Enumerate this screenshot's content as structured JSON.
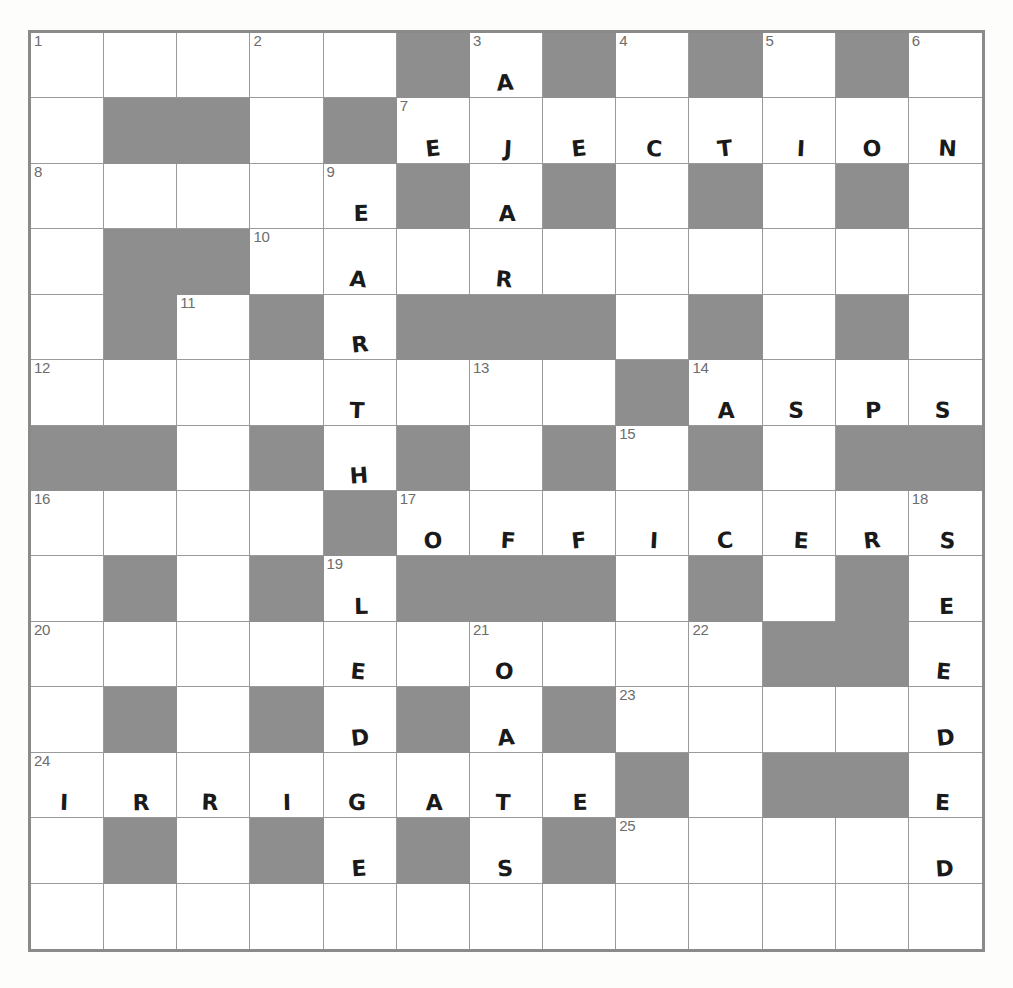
{
  "puzzle": {
    "kind": "crossword-grid",
    "columns": 13,
    "rows": 14,
    "colors": {
      "block": "#8e8e8e",
      "cell": "#ffffff",
      "gridline": "#9a9a9a",
      "border": "#8a8a8a",
      "number": "#6d6d6d",
      "letter": "#1a1a1a"
    },
    "answers_entered": {
      "across": [
        {
          "number": "7",
          "text": "EJECTION"
        },
        {
          "number": "14",
          "text": "ASPS"
        },
        {
          "number": "17",
          "text": "OFFICERS"
        },
        {
          "number": "24",
          "text": "IRRIGATE"
        }
      ],
      "down": [
        {
          "number": "9",
          "text": "EARTHLEDGE"
        },
        {
          "number": "3",
          "text": "AARTOASTS"
        },
        {
          "number": "18",
          "text": "SEEDED"
        }
      ]
    },
    "cells": [
      [
        {
          "b": false,
          "n": "1",
          "l": ""
        },
        {
          "b": false,
          "n": "",
          "l": ""
        },
        {
          "b": false,
          "n": "",
          "l": ""
        },
        {
          "b": false,
          "n": "2",
          "l": ""
        },
        {
          "b": false,
          "n": "",
          "l": ""
        },
        {
          "b": true,
          "n": "",
          "l": ""
        },
        {
          "b": false,
          "n": "3",
          "l": "A"
        },
        {
          "b": true,
          "n": "",
          "l": ""
        },
        {
          "b": false,
          "n": "4",
          "l": ""
        },
        {
          "b": true,
          "n": "",
          "l": ""
        },
        {
          "b": false,
          "n": "5",
          "l": ""
        },
        {
          "b": true,
          "n": "",
          "l": ""
        },
        {
          "b": false,
          "n": "6",
          "l": ""
        }
      ],
      [
        {
          "b": false,
          "n": "",
          "l": ""
        },
        {
          "b": true,
          "n": "",
          "l": ""
        },
        {
          "b": true,
          "n": "",
          "l": ""
        },
        {
          "b": false,
          "n": "",
          "l": ""
        },
        {
          "b": true,
          "n": "",
          "l": ""
        },
        {
          "b": false,
          "n": "7",
          "l": "E"
        },
        {
          "b": false,
          "n": "",
          "l": "J"
        },
        {
          "b": false,
          "n": "",
          "l": "E"
        },
        {
          "b": false,
          "n": "",
          "l": "C"
        },
        {
          "b": false,
          "n": "",
          "l": "T"
        },
        {
          "b": false,
          "n": "",
          "l": "I"
        },
        {
          "b": false,
          "n": "",
          "l": "O"
        },
        {
          "b": false,
          "n": "",
          "l": "N"
        }
      ],
      [
        {
          "b": false,
          "n": "8",
          "l": ""
        },
        {
          "b": false,
          "n": "",
          "l": ""
        },
        {
          "b": false,
          "n": "",
          "l": ""
        },
        {
          "b": false,
          "n": "",
          "l": ""
        },
        {
          "b": false,
          "n": "9",
          "l": "E"
        },
        {
          "b": true,
          "n": "",
          "l": ""
        },
        {
          "b": false,
          "n": "",
          "l": "A"
        },
        {
          "b": true,
          "n": "",
          "l": ""
        },
        {
          "b": false,
          "n": "",
          "l": ""
        },
        {
          "b": true,
          "n": "",
          "l": ""
        },
        {
          "b": false,
          "n": "",
          "l": ""
        },
        {
          "b": true,
          "n": "",
          "l": ""
        },
        {
          "b": false,
          "n": "",
          "l": ""
        }
      ],
      [
        {
          "b": false,
          "n": "",
          "l": ""
        },
        {
          "b": true,
          "n": "",
          "l": ""
        },
        {
          "b": true,
          "n": "",
          "l": ""
        },
        {
          "b": false,
          "n": "10",
          "l": ""
        },
        {
          "b": false,
          "n": "",
          "l": "A"
        },
        {
          "b": false,
          "n": "",
          "l": ""
        },
        {
          "b": false,
          "n": "",
          "l": "R"
        },
        {
          "b": false,
          "n": "",
          "l": ""
        },
        {
          "b": false,
          "n": "",
          "l": ""
        },
        {
          "b": false,
          "n": "",
          "l": ""
        },
        {
          "b": false,
          "n": "",
          "l": ""
        },
        {
          "b": false,
          "n": "",
          "l": ""
        },
        {
          "b": false,
          "n": "",
          "l": ""
        }
      ],
      [
        {
          "b": false,
          "n": "",
          "l": ""
        },
        {
          "b": true,
          "n": "",
          "l": ""
        },
        {
          "b": false,
          "n": "11",
          "l": ""
        },
        {
          "b": true,
          "n": "",
          "l": ""
        },
        {
          "b": false,
          "n": "",
          "l": "R"
        },
        {
          "b": true,
          "n": "",
          "l": ""
        },
        {
          "b": true,
          "n": "",
          "l": ""
        },
        {
          "b": true,
          "n": "",
          "l": ""
        },
        {
          "b": false,
          "n": "",
          "l": ""
        },
        {
          "b": true,
          "n": "",
          "l": ""
        },
        {
          "b": false,
          "n": "",
          "l": ""
        },
        {
          "b": true,
          "n": "",
          "l": ""
        },
        {
          "b": false,
          "n": "",
          "l": ""
        }
      ],
      [
        {
          "b": false,
          "n": "12",
          "l": ""
        },
        {
          "b": false,
          "n": "",
          "l": ""
        },
        {
          "b": false,
          "n": "",
          "l": ""
        },
        {
          "b": false,
          "n": "",
          "l": ""
        },
        {
          "b": false,
          "n": "",
          "l": "T"
        },
        {
          "b": false,
          "n": "",
          "l": ""
        },
        {
          "b": false,
          "n": "13",
          "l": ""
        },
        {
          "b": false,
          "n": "",
          "l": ""
        },
        {
          "b": true,
          "n": "",
          "l": ""
        },
        {
          "b": false,
          "n": "14",
          "l": "A"
        },
        {
          "b": false,
          "n": "",
          "l": "S"
        },
        {
          "b": false,
          "n": "",
          "l": "P"
        },
        {
          "b": false,
          "n": "",
          "l": "S"
        }
      ],
      [
        {
          "b": true,
          "n": "",
          "l": ""
        },
        {
          "b": true,
          "n": "",
          "l": ""
        },
        {
          "b": false,
          "n": "",
          "l": ""
        },
        {
          "b": true,
          "n": "",
          "l": ""
        },
        {
          "b": false,
          "n": "",
          "l": "H"
        },
        {
          "b": true,
          "n": "",
          "l": ""
        },
        {
          "b": false,
          "n": "",
          "l": ""
        },
        {
          "b": true,
          "n": "",
          "l": ""
        },
        {
          "b": false,
          "n": "15",
          "l": ""
        },
        {
          "b": true,
          "n": "",
          "l": ""
        },
        {
          "b": false,
          "n": "",
          "l": ""
        },
        {
          "b": true,
          "n": "",
          "l": ""
        },
        {
          "b": true,
          "n": "",
          "l": ""
        }
      ],
      [
        {
          "b": false,
          "n": "16",
          "l": ""
        },
        {
          "b": false,
          "n": "",
          "l": ""
        },
        {
          "b": false,
          "n": "",
          "l": ""
        },
        {
          "b": false,
          "n": "",
          "l": ""
        },
        {
          "b": true,
          "n": "",
          "l": ""
        },
        {
          "b": false,
          "n": "17",
          "l": "O"
        },
        {
          "b": false,
          "n": "",
          "l": "F"
        },
        {
          "b": false,
          "n": "",
          "l": "F"
        },
        {
          "b": false,
          "n": "",
          "l": "I"
        },
        {
          "b": false,
          "n": "",
          "l": "C"
        },
        {
          "b": false,
          "n": "",
          "l": "E"
        },
        {
          "b": false,
          "n": "",
          "l": "R"
        },
        {
          "b": false,
          "n": "18",
          "l": "S"
        }
      ],
      [
        {
          "b": false,
          "n": "",
          "l": ""
        },
        {
          "b": true,
          "n": "",
          "l": ""
        },
        {
          "b": false,
          "n": "",
          "l": ""
        },
        {
          "b": true,
          "n": "",
          "l": ""
        },
        {
          "b": false,
          "n": "19",
          "l": "L"
        },
        {
          "b": true,
          "n": "",
          "l": ""
        },
        {
          "b": true,
          "n": "",
          "l": ""
        },
        {
          "b": true,
          "n": "",
          "l": ""
        },
        {
          "b": false,
          "n": "",
          "l": ""
        },
        {
          "b": true,
          "n": "",
          "l": ""
        },
        {
          "b": false,
          "n": "",
          "l": ""
        },
        {
          "b": true,
          "n": "",
          "l": ""
        },
        {
          "b": false,
          "n": "",
          "l": "E"
        }
      ],
      [
        {
          "b": false,
          "n": "20",
          "l": ""
        },
        {
          "b": false,
          "n": "",
          "l": ""
        },
        {
          "b": false,
          "n": "",
          "l": ""
        },
        {
          "b": false,
          "n": "",
          "l": ""
        },
        {
          "b": false,
          "n": "",
          "l": "E"
        },
        {
          "b": false,
          "n": "",
          "l": ""
        },
        {
          "b": false,
          "n": "21",
          "l": "O"
        },
        {
          "b": false,
          "n": "",
          "l": ""
        },
        {
          "b": false,
          "n": "",
          "l": ""
        },
        {
          "b": false,
          "n": "22",
          "l": ""
        },
        {
          "b": true,
          "n": "",
          "l": ""
        },
        {
          "b": true,
          "n": "",
          "l": ""
        },
        {
          "b": false,
          "n": "",
          "l": "E"
        }
      ],
      [
        {
          "b": false,
          "n": "",
          "l": ""
        },
        {
          "b": true,
          "n": "",
          "l": ""
        },
        {
          "b": false,
          "n": "",
          "l": ""
        },
        {
          "b": true,
          "n": "",
          "l": ""
        },
        {
          "b": false,
          "n": "",
          "l": "D"
        },
        {
          "b": true,
          "n": "",
          "l": ""
        },
        {
          "b": false,
          "n": "",
          "l": "A"
        },
        {
          "b": true,
          "n": "",
          "l": ""
        },
        {
          "b": false,
          "n": "23",
          "l": ""
        },
        {
          "b": false,
          "n": "",
          "l": ""
        },
        {
          "b": false,
          "n": "",
          "l": ""
        },
        {
          "b": false,
          "n": "",
          "l": ""
        },
        {
          "b": false,
          "n": "",
          "l": "D"
        }
      ],
      [
        {
          "b": false,
          "n": "24",
          "l": "I"
        },
        {
          "b": false,
          "n": "",
          "l": "R"
        },
        {
          "b": false,
          "n": "",
          "l": "R"
        },
        {
          "b": false,
          "n": "",
          "l": "I"
        },
        {
          "b": false,
          "n": "",
          "l": "G"
        },
        {
          "b": false,
          "n": "",
          "l": "A"
        },
        {
          "b": false,
          "n": "",
          "l": "T"
        },
        {
          "b": false,
          "n": "",
          "l": "E"
        },
        {
          "b": true,
          "n": "",
          "l": ""
        },
        {
          "b": false,
          "n": "",
          "l": ""
        },
        {
          "b": true,
          "n": "",
          "l": ""
        },
        {
          "b": true,
          "n": "",
          "l": ""
        },
        {
          "b": false,
          "n": "",
          "l": "E"
        }
      ],
      [
        {
          "b": false,
          "n": "",
          "l": ""
        },
        {
          "b": true,
          "n": "",
          "l": ""
        },
        {
          "b": false,
          "n": "",
          "l": ""
        },
        {
          "b": true,
          "n": "",
          "l": ""
        },
        {
          "b": false,
          "n": "",
          "l": "E"
        },
        {
          "b": true,
          "n": "",
          "l": ""
        },
        {
          "b": false,
          "n": "",
          "l": "S"
        },
        {
          "b": true,
          "n": "",
          "l": ""
        },
        {
          "b": false,
          "n": "25",
          "l": ""
        },
        {
          "b": false,
          "n": "",
          "l": ""
        },
        {
          "b": false,
          "n": "",
          "l": ""
        },
        {
          "b": false,
          "n": "",
          "l": ""
        },
        {
          "b": false,
          "n": "",
          "l": "D"
        }
      ],
      [
        {
          "b": false,
          "n": "",
          "l": ""
        },
        {
          "b": false,
          "n": "",
          "l": ""
        },
        {
          "b": false,
          "n": "",
          "l": ""
        },
        {
          "b": false,
          "n": "",
          "l": ""
        },
        {
          "b": false,
          "n": "",
          "l": ""
        },
        {
          "b": false,
          "n": "",
          "l": ""
        },
        {
          "b": false,
          "n": "",
          "l": ""
        },
        {
          "b": false,
          "n": "",
          "l": ""
        },
        {
          "b": false,
          "n": "",
          "l": ""
        },
        {
          "b": false,
          "n": "",
          "l": ""
        },
        {
          "b": false,
          "n": "",
          "l": ""
        },
        {
          "b": false,
          "n": "",
          "l": ""
        },
        {
          "b": false,
          "n": "",
          "l": ""
        }
      ]
    ]
  }
}
